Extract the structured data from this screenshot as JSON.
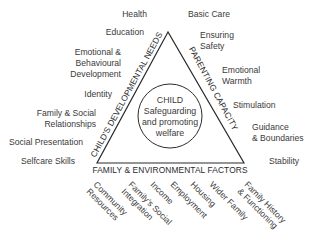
{
  "diagram": {
    "center": {
      "title": "CHILD",
      "line1": "Safeguarding",
      "line2": "and promoting",
      "line3": "welfare"
    },
    "sides": {
      "left": "CHILD'S DEVELOPMENTAL NEEDS",
      "right": "PARENTING CAPACITY",
      "bottom": "FAMILY & ENVIRONMENTAL FACTORS"
    },
    "developmental_needs": [
      {
        "lines": [
          "Health"
        ]
      },
      {
        "lines": [
          "Education"
        ]
      },
      {
        "lines": [
          "Emotional &",
          "Behavioural",
          "Development"
        ]
      },
      {
        "lines": [
          "Identity"
        ]
      },
      {
        "lines": [
          "Family & Social",
          "Relationships"
        ]
      },
      {
        "lines": [
          "Social Presentation"
        ]
      },
      {
        "lines": [
          "Selfcare Skills"
        ]
      }
    ],
    "parenting_capacity": [
      {
        "lines": [
          "Basic Care"
        ]
      },
      {
        "lines": [
          "Ensuring",
          "Safety"
        ]
      },
      {
        "lines": [
          "Emotional",
          "Warmth"
        ]
      },
      {
        "lines": [
          "Stimulation"
        ]
      },
      {
        "lines": [
          "Guidance",
          "& Boundaries"
        ]
      },
      {
        "lines": [
          "Stability"
        ]
      }
    ],
    "family_environmental": [
      {
        "lines": [
          "Community",
          "Resources"
        ]
      },
      {
        "lines": [
          "Family's Social",
          "Integration"
        ]
      },
      {
        "lines": [
          "Income"
        ]
      },
      {
        "lines": [
          "Employment"
        ]
      },
      {
        "lines": [
          "Housing"
        ]
      },
      {
        "lines": [
          "Wider Family"
        ]
      },
      {
        "lines": [
          "Family History",
          "& Functioning"
        ]
      }
    ],
    "colors": {
      "line": "#2b2b2b",
      "text": "#3a3a3a",
      "background": "#ffffff"
    }
  }
}
